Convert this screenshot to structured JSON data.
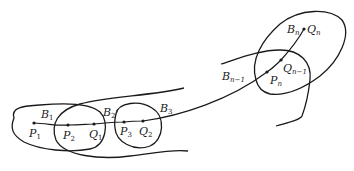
{
  "diagram": {
    "regions": [
      {
        "id": "B1",
        "label": "B",
        "sub": "1"
      },
      {
        "id": "B2",
        "label": "B",
        "sub": "2"
      },
      {
        "id": "B3",
        "label": "B",
        "sub": "3"
      },
      {
        "id": "Bn-1",
        "label": "B",
        "sub": "n−1"
      },
      {
        "id": "Bn",
        "label": "B",
        "sub": "n"
      }
    ],
    "points": [
      {
        "id": "P1",
        "label": "P",
        "sub": "1"
      },
      {
        "id": "P2",
        "label": "P",
        "sub": "2"
      },
      {
        "id": "Q1",
        "label": "Q",
        "sub": "1"
      },
      {
        "id": "P3",
        "label": "P",
        "sub": "3"
      },
      {
        "id": "Q2",
        "label": "Q",
        "sub": "2"
      },
      {
        "id": "Pn",
        "label": "P",
        "sub": "n"
      },
      {
        "id": "Qn-1",
        "label": "Q",
        "sub": "n−1"
      },
      {
        "id": "Qn",
        "label": "Q",
        "sub": "n"
      }
    ]
  }
}
